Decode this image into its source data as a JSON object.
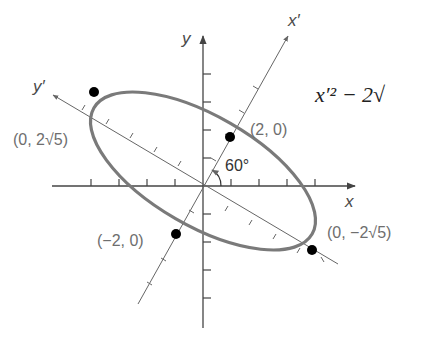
{
  "diagram": {
    "axes": {
      "x_label": "x",
      "y_label": "y",
      "x_prime_label": "x′",
      "y_prime_label": "y′"
    },
    "angle_label": "60°",
    "points": [
      {
        "label": "(2, 0)"
      },
      {
        "label": "(−2, 0)"
      },
      {
        "label": "(0, 2√5)"
      },
      {
        "label": "(0, −2√5)"
      }
    ],
    "equation_fragment": "x′² − 2√",
    "colors": {
      "axis": "#444444",
      "ellipse": "#7a7a7a",
      "point": "#000000",
      "label": "#6e6e6e"
    }
  }
}
